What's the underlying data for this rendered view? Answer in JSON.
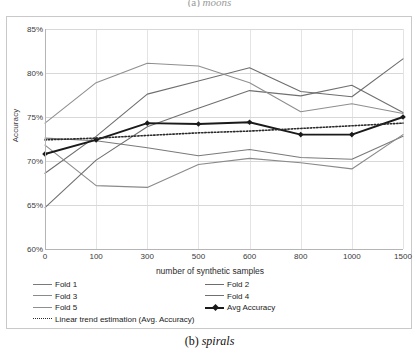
{
  "figure": {
    "top_caption_prefix": "(a)",
    "top_caption_name": "moons",
    "bottom_caption_prefix": "(b)",
    "bottom_caption_name": "spirals"
  },
  "chart_data": {
    "type": "line",
    "title": "",
    "xlabel": "number of synthetic samples",
    "ylabel": "Accuracy",
    "categories": [
      "0",
      "100",
      "300",
      "500",
      "600",
      "800",
      "1000",
      "1500"
    ],
    "ylim": [
      60,
      85
    ],
    "yticks": [
      "60%",
      "65%",
      "70%",
      "75%",
      "80%",
      "85%"
    ],
    "ytick_values": [
      60,
      65,
      70,
      75,
      80,
      85
    ],
    "grid": true,
    "legend_position": "below-plot",
    "series": [
      {
        "name": "Fold 1",
        "values": [
          72.6,
          72.3,
          71.5,
          70.6,
          71.3,
          70.4,
          70.2,
          72.8
        ],
        "color": "#7a7a7a",
        "style": "solid"
      },
      {
        "name": "Fold 2",
        "values": [
          68.6,
          72.8,
          77.6,
          79.1,
          80.6,
          77.9,
          77.3,
          81.6
        ],
        "color": "#6e6e6e",
        "style": "solid"
      },
      {
        "name": "Fold 3",
        "values": [
          71.8,
          67.2,
          67.0,
          69.6,
          70.3,
          69.8,
          69.1,
          73.0
        ],
        "color": "#8a8a8a",
        "style": "solid"
      },
      {
        "name": "Fold 4",
        "values": [
          64.7,
          70.1,
          73.9,
          76.0,
          78.0,
          77.4,
          78.6,
          75.5
        ],
        "color": "#707070",
        "style": "solid"
      },
      {
        "name": "Fold 5",
        "values": [
          74.3,
          78.9,
          81.1,
          80.8,
          78.9,
          75.6,
          76.5,
          75.4
        ],
        "color": "#8f8f8f",
        "style": "solid"
      },
      {
        "name": "Avg Accuracy",
        "values": [
          70.8,
          72.4,
          74.3,
          74.2,
          74.4,
          73.0,
          73.0,
          75.0
        ],
        "color": "#1a1a1a",
        "style": "solid-marker"
      },
      {
        "name": "Linear trend estimation (Avg. Accuracy)",
        "values": [
          72.4,
          72.6,
          72.9,
          73.2,
          73.4,
          73.7,
          74.0,
          74.3
        ],
        "color": "#2a2a2a",
        "style": "dotted"
      }
    ]
  },
  "legend": {
    "items": [
      {
        "label": "Fold 1",
        "style": "solid"
      },
      {
        "label": "Fold 2",
        "style": "solid"
      },
      {
        "label": "Fold 3",
        "style": "solid"
      },
      {
        "label": "Fold 4",
        "style": "solid"
      },
      {
        "label": "Fold 5",
        "style": "solid"
      },
      {
        "label": "Avg Accuracy",
        "style": "solid-marker"
      },
      {
        "label": "Linear trend estimation (Avg. Accuracy)",
        "style": "dotted"
      }
    ]
  }
}
